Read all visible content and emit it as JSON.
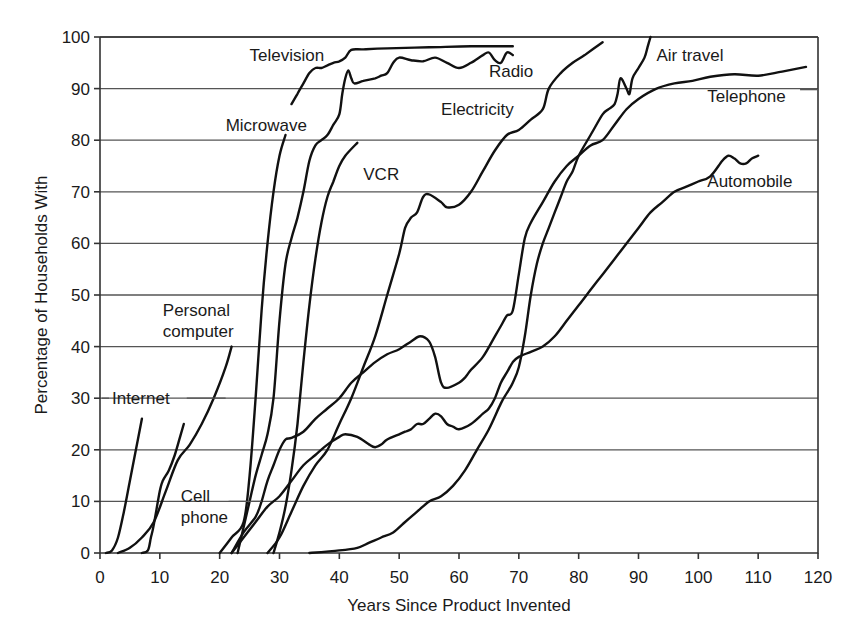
{
  "chart_data": {
    "type": "line",
    "title": "",
    "xlabel": "Years Since Product Invented",
    "ylabel": "Percentage of Households With",
    "xlim": [
      0,
      120
    ],
    "ylim": [
      0,
      100
    ],
    "xticks": [
      0,
      10,
      20,
      30,
      40,
      50,
      60,
      70,
      80,
      90,
      100,
      110,
      120
    ],
    "yticks": [
      0,
      10,
      20,
      30,
      40,
      50,
      60,
      70,
      80,
      90,
      100
    ],
    "grid": "horizontal",
    "legend": "inline labels",
    "series": [
      {
        "name": "Internet",
        "label_pos": [
          2,
          30
        ],
        "leader": [
          [
            0.3,
            30
          ],
          [
            1.5,
            30
          ]
        ],
        "leader2": [
          [
            14.5,
            30
          ],
          [
            21,
            30
          ]
        ],
        "points": [
          [
            1,
            0
          ],
          [
            2,
            0.5
          ],
          [
            3,
            3
          ],
          [
            4,
            8
          ],
          [
            5,
            14
          ],
          [
            6,
            20
          ],
          [
            7,
            26
          ]
        ]
      },
      {
        "name": "Cell phone",
        "label_pos": [
          13.5,
          11
        ],
        "label_lines": [
          "Cell",
          "phone"
        ],
        "leader": [
          [
            21.5,
            10
          ],
          [
            27,
            10
          ]
        ],
        "points": [
          [
            7,
            0
          ],
          [
            8,
            0.5
          ],
          [
            8.5,
            3
          ],
          [
            9,
            5.5
          ],
          [
            10,
            12
          ],
          [
            10.5,
            14
          ],
          [
            11.5,
            16
          ],
          [
            12.5,
            19
          ],
          [
            13.5,
            23
          ],
          [
            14,
            25
          ]
        ]
      },
      {
        "name": "Personal computer",
        "label_pos": [
          10.5,
          47
        ],
        "label_lines": [
          "Personal",
          "computer"
        ],
        "points": [
          [
            3,
            0
          ],
          [
            5,
            1
          ],
          [
            7,
            3
          ],
          [
            9,
            6
          ],
          [
            11,
            12
          ],
          [
            13,
            18
          ],
          [
            15,
            21
          ],
          [
            17,
            25
          ],
          [
            19,
            30
          ],
          [
            21,
            36
          ],
          [
            22,
            40
          ]
        ]
      },
      {
        "name": "Television",
        "label_pos": [
          25,
          96.5
        ],
        "points": [
          [
            32,
            87
          ],
          [
            33,
            89
          ],
          [
            34,
            91
          ],
          [
            35,
            93
          ],
          [
            36,
            94
          ],
          [
            37,
            94
          ],
          [
            38,
            94.5
          ],
          [
            39,
            95
          ],
          [
            40,
            95.3
          ],
          [
            41,
            96
          ],
          [
            42,
            97.5
          ],
          [
            44,
            97.6
          ],
          [
            48,
            97.8
          ],
          [
            55,
            98
          ],
          [
            62,
            98.2
          ],
          [
            69,
            98.2
          ]
        ]
      },
      {
        "name": "Microwave",
        "label_pos": [
          21,
          83
        ],
        "points": [
          [
            20,
            0
          ],
          [
            22,
            3
          ],
          [
            24,
            6
          ],
          [
            25,
            15
          ],
          [
            26,
            30
          ],
          [
            27,
            47
          ],
          [
            28,
            60
          ],
          [
            29,
            70
          ],
          [
            30,
            77
          ],
          [
            31,
            81
          ]
        ]
      },
      {
        "name": "Radio",
        "label_pos": [
          65,
          93.5
        ],
        "points": [
          [
            23,
            0
          ],
          [
            24,
            5
          ],
          [
            25,
            10
          ],
          [
            26,
            15
          ],
          [
            27,
            19
          ],
          [
            28,
            23
          ],
          [
            29,
            30
          ],
          [
            30,
            45
          ],
          [
            31,
            56
          ],
          [
            32,
            61
          ],
          [
            33,
            65
          ],
          [
            34,
            70
          ],
          [
            35,
            76
          ],
          [
            36,
            79
          ],
          [
            37,
            80
          ],
          [
            38,
            81
          ],
          [
            39,
            83
          ],
          [
            40,
            85
          ],
          [
            40.5,
            89
          ],
          [
            41,
            92
          ],
          [
            41.5,
            93.5
          ],
          [
            42,
            92
          ],
          [
            42.5,
            91
          ],
          [
            44,
            91.5
          ],
          [
            46,
            92
          ],
          [
            47,
            92.5
          ],
          [
            48,
            93
          ],
          [
            49,
            95
          ],
          [
            50,
            96
          ],
          [
            52,
            95.5
          ],
          [
            54,
            95.3
          ],
          [
            56,
            96
          ],
          [
            58,
            95
          ],
          [
            60,
            94
          ],
          [
            62,
            95
          ],
          [
            64,
            96.5
          ],
          [
            65,
            97
          ],
          [
            66,
            95.5
          ],
          [
            67,
            95
          ],
          [
            68,
            97
          ],
          [
            69,
            96.5
          ]
        ]
      },
      {
        "name": "VCR",
        "label_pos": [
          44,
          73.5
        ],
        "points": [
          [
            29,
            0
          ],
          [
            30,
            4
          ],
          [
            31,
            9
          ],
          [
            32,
            16
          ],
          [
            33,
            25
          ],
          [
            34,
            37
          ],
          [
            35,
            48
          ],
          [
            36,
            57
          ],
          [
            37,
            64
          ],
          [
            38,
            69
          ],
          [
            39,
            72
          ],
          [
            40,
            75
          ],
          [
            41,
            77
          ],
          [
            43,
            79.5
          ]
        ]
      },
      {
        "name": "Electricity",
        "label_pos": [
          57,
          86
        ],
        "points": [
          [
            28,
            0
          ],
          [
            30,
            3
          ],
          [
            32,
            8
          ],
          [
            34,
            13
          ],
          [
            36,
            17
          ],
          [
            38,
            20
          ],
          [
            40,
            25
          ],
          [
            42,
            30
          ],
          [
            44,
            36
          ],
          [
            46,
            42
          ],
          [
            48,
            50
          ],
          [
            50,
            58
          ],
          [
            51,
            63
          ],
          [
            52,
            65
          ],
          [
            53,
            66
          ],
          [
            54,
            69
          ],
          [
            55,
            69.5
          ],
          [
            57,
            68
          ],
          [
            58,
            67
          ],
          [
            60,
            67.5
          ],
          [
            62,
            70
          ],
          [
            64,
            74
          ],
          [
            66,
            78
          ],
          [
            68,
            81
          ],
          [
            70,
            82
          ],
          [
            72,
            84
          ],
          [
            74,
            86
          ],
          [
            75,
            90
          ],
          [
            77,
            93
          ],
          [
            79,
            95
          ],
          [
            81,
            96.5
          ],
          [
            84,
            99
          ]
        ]
      },
      {
        "name": "Telephone",
        "label_pos": [
          101.5,
          88.5
        ],
        "leader": [
          [
            117,
            89.8
          ],
          [
            120,
            89.8
          ]
        ],
        "points": [
          [
            22,
            0
          ],
          [
            24,
            4
          ],
          [
            26,
            7
          ],
          [
            27,
            10
          ],
          [
            28,
            14
          ],
          [
            29,
            17
          ],
          [
            30,
            20
          ],
          [
            31,
            22
          ],
          [
            32,
            22.3
          ],
          [
            34,
            23.5
          ],
          [
            36,
            26
          ],
          [
            38,
            28
          ],
          [
            40,
            30
          ],
          [
            42,
            33
          ],
          [
            44,
            35
          ],
          [
            46,
            37
          ],
          [
            48,
            38.5
          ],
          [
            50,
            39.5
          ],
          [
            52,
            41
          ],
          [
            53.5,
            42
          ],
          [
            55,
            41
          ],
          [
            56,
            38
          ],
          [
            57,
            33
          ],
          [
            58,
            32
          ],
          [
            60,
            33
          ],
          [
            61,
            34
          ],
          [
            62,
            35.5
          ],
          [
            64,
            38
          ],
          [
            66,
            42
          ],
          [
            67,
            44
          ],
          [
            68,
            46
          ],
          [
            69,
            47
          ],
          [
            70,
            54
          ],
          [
            71,
            61
          ],
          [
            72,
            64
          ],
          [
            74,
            68
          ],
          [
            76,
            72
          ],
          [
            78,
            75
          ],
          [
            80,
            77
          ],
          [
            82,
            79
          ],
          [
            84,
            80
          ],
          [
            86,
            83
          ],
          [
            88,
            86
          ],
          [
            90,
            88
          ],
          [
            93,
            90
          ],
          [
            96,
            91
          ],
          [
            99,
            91.5
          ],
          [
            102,
            92.3
          ],
          [
            106,
            92.8
          ],
          [
            110,
            92.5
          ],
          [
            114,
            93.3
          ],
          [
            118,
            94.2
          ]
        ]
      },
      {
        "name": "Air travel",
        "label_pos": [
          93,
          96.5
        ],
        "points": [
          [
            35,
            0
          ],
          [
            40,
            0.5
          ],
          [
            43,
            1
          ],
          [
            45,
            2
          ],
          [
            47,
            3
          ],
          [
            49,
            4
          ],
          [
            51,
            6
          ],
          [
            53,
            8
          ],
          [
            55,
            10
          ],
          [
            57,
            11
          ],
          [
            59,
            13
          ],
          [
            61,
            16
          ],
          [
            63,
            20
          ],
          [
            65,
            24
          ],
          [
            67,
            29
          ],
          [
            68,
            31
          ],
          [
            69,
            33
          ],
          [
            70,
            36
          ],
          [
            71,
            42
          ],
          [
            72,
            50
          ],
          [
            73,
            56
          ],
          [
            74,
            60
          ],
          [
            75,
            63
          ],
          [
            76,
            66
          ],
          [
            77,
            69
          ],
          [
            78,
            72
          ],
          [
            79,
            74
          ],
          [
            80,
            77
          ],
          [
            82,
            81
          ],
          [
            84,
            85
          ],
          [
            85,
            86
          ],
          [
            86,
            87
          ],
          [
            86.5,
            89
          ],
          [
            87,
            92
          ],
          [
            88,
            90
          ],
          [
            88.5,
            89
          ],
          [
            89,
            92
          ],
          [
            90,
            94
          ],
          [
            91,
            96
          ],
          [
            91.5,
            98
          ],
          [
            92,
            100
          ]
        ]
      },
      {
        "name": "Automobile",
        "label_pos": [
          101.5,
          72
        ],
        "points": [
          [
            22,
            0
          ],
          [
            24,
            3
          ],
          [
            26,
            6
          ],
          [
            28,
            9
          ],
          [
            30,
            11
          ],
          [
            32,
            14
          ],
          [
            34,
            17
          ],
          [
            36,
            19
          ],
          [
            38,
            21
          ],
          [
            40,
            22.5
          ],
          [
            41,
            23
          ],
          [
            43,
            22.5
          ],
          [
            45,
            21
          ],
          [
            46,
            20.5
          ],
          [
            47,
            21
          ],
          [
            48,
            22
          ],
          [
            50,
            23
          ],
          [
            51,
            23.5
          ],
          [
            52,
            24
          ],
          [
            53,
            25
          ],
          [
            54,
            25
          ],
          [
            55,
            26
          ],
          [
            56,
            27
          ],
          [
            57,
            26.5
          ],
          [
            58,
            25
          ],
          [
            59,
            24.5
          ],
          [
            60,
            24
          ],
          [
            62,
            25
          ],
          [
            64,
            27
          ],
          [
            65,
            28
          ],
          [
            66,
            30
          ],
          [
            67,
            33
          ],
          [
            68,
            35
          ],
          [
            69,
            37
          ],
          [
            70,
            38
          ],
          [
            72,
            39
          ],
          [
            74,
            40
          ],
          [
            76,
            42
          ],
          [
            78,
            45
          ],
          [
            80,
            48
          ],
          [
            82,
            51
          ],
          [
            84,
            54
          ],
          [
            86,
            57
          ],
          [
            88,
            60
          ],
          [
            90,
            63
          ],
          [
            92,
            66
          ],
          [
            94,
            68
          ],
          [
            96,
            70
          ],
          [
            98,
            71
          ],
          [
            100,
            72
          ],
          [
            102,
            73
          ],
          [
            104,
            76
          ],
          [
            105,
            77
          ],
          [
            106,
            76.5
          ],
          [
            107,
            75.5
          ],
          [
            108,
            75.5
          ],
          [
            109,
            76.5
          ],
          [
            110,
            77
          ]
        ]
      }
    ]
  },
  "axes": {
    "x_title": "Years Since Product Invented",
    "y_title": "Percentage of Households With"
  }
}
